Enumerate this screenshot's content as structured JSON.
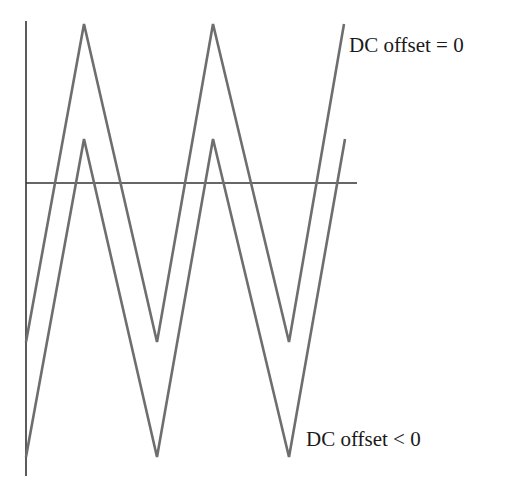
{
  "diagram": {
    "labels": {
      "upper": "DC offset = 0",
      "lower": "DC offset < 0"
    },
    "colors": {
      "wave": "#6e6e6e",
      "axis": "#333333",
      "text": "#1a1a1a",
      "background": "#ffffff"
    },
    "axes": {
      "vertical": {
        "x": 26,
        "y1": 21,
        "y2": 476
      },
      "horizontal": {
        "y": 183,
        "x1": 26,
        "x2": 357
      }
    },
    "waves": [
      {
        "name": "DC offset = 0",
        "points": [
          [
            26,
            342
          ],
          [
            84,
            24
          ],
          [
            157,
            342
          ],
          [
            213,
            24
          ],
          [
            289,
            342
          ],
          [
            344,
            24
          ]
        ]
      },
      {
        "name": "DC offset < 0",
        "points": [
          [
            26,
            457
          ],
          [
            84,
            139
          ],
          [
            157,
            457
          ],
          [
            213,
            139
          ],
          [
            289,
            457
          ],
          [
            345,
            139
          ]
        ]
      }
    ]
  }
}
